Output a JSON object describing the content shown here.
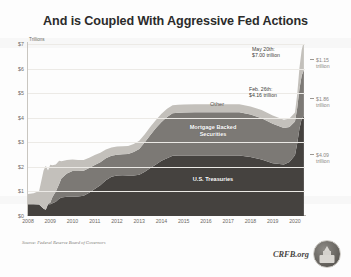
{
  "title": "And is Coupled With Aggressive Fed Actions",
  "axes": {
    "y_unit": "Trillions",
    "y_ticks": [
      "$7",
      "$6",
      "$5",
      "$4",
      "$3",
      "$2",
      "$1",
      "$0"
    ],
    "x_ticks": [
      "2008",
      "2009",
      "2010",
      "2011",
      "2012",
      "2013",
      "2014",
      "2015",
      "2016",
      "2017",
      "2018",
      "2019",
      "2020"
    ]
  },
  "series_labels": {
    "other": "Other",
    "mbs": "Mortgage Backed\nSecurities",
    "treasuries": "U.S. Treasuries"
  },
  "callouts": {
    "may": "May 20th:\n$7.00 trillion",
    "feb": "Feb. 26th:\n$4.16 trillion"
  },
  "right_labels": {
    "other": "$1.15\ntrillion",
    "mbs": "$1.86\ntrillion",
    "treasuries": "$4.09\ntrillion"
  },
  "footer": {
    "source": "Source: Federal Reserve Board of Governors",
    "brand": "CRFB.org",
    "logo_icon": "capitol-dome-icon"
  },
  "colors": {
    "other": "#c3c0bb",
    "mbs": "#7c7975",
    "treasuries": "#45423f",
    "title": "#2b2b2b",
    "axis": "#6d6a65"
  },
  "chart_data": {
    "type": "area",
    "title": "And is Coupled With Aggressive Fed Actions",
    "subtitle": "",
    "xlabel": "",
    "ylabel": "Trillions",
    "ylim": [
      0,
      7
    ],
    "xlim": [
      2008,
      2020.45
    ],
    "grid": true,
    "stacked": true,
    "legend": "inline-labels",
    "annotations": [
      {
        "text": "May 20th: $7.00 trillion",
        "x": 2020.38,
        "y": 7.0
      },
      {
        "text": "Feb. 26th: $4.16 trillion",
        "x": 2020.15,
        "y": 4.16
      },
      {
        "text": "$1.15 trillion",
        "x": 2020.45,
        "y": 6.43
      },
      {
        "text": "$1.86 trillion",
        "x": 2020.45,
        "y": 5.02
      },
      {
        "text": "$4.09 trillion",
        "x": 2020.45,
        "y": 2.05
      }
    ],
    "x": [
      2008.0,
      2008.25,
      2008.5,
      2008.7,
      2008.8,
      2008.9,
      2009.0,
      2009.1,
      2009.25,
      2009.4,
      2009.5,
      2009.75,
      2010.0,
      2010.25,
      2010.5,
      2010.75,
      2011.0,
      2011.25,
      2011.5,
      2011.75,
      2012.0,
      2012.25,
      2012.5,
      2012.75,
      2013.0,
      2013.25,
      2013.5,
      2013.75,
      2014.0,
      2014.25,
      2014.5,
      2014.75,
      2015.0,
      2015.5,
      2016.0,
      2016.5,
      2017.0,
      2017.5,
      2018.0,
      2018.5,
      2019.0,
      2019.5,
      2019.75,
      2020.0,
      2020.1,
      2020.2,
      2020.3,
      2020.4
    ],
    "series": [
      {
        "name": "U.S. Treasuries",
        "color": "#45423f",
        "values": [
          0.48,
          0.48,
          0.47,
          0.3,
          0.25,
          0.48,
          0.48,
          0.52,
          0.58,
          0.7,
          0.75,
          0.78,
          0.78,
          0.79,
          0.82,
          0.95,
          1.1,
          1.25,
          1.45,
          1.6,
          1.65,
          1.66,
          1.65,
          1.65,
          1.68,
          1.8,
          1.95,
          2.1,
          2.25,
          2.35,
          2.45,
          2.46,
          2.46,
          2.46,
          2.46,
          2.46,
          2.46,
          2.46,
          2.4,
          2.3,
          2.15,
          2.1,
          2.2,
          2.47,
          2.95,
          3.55,
          3.95,
          4.09
        ]
      },
      {
        "name": "Mortgage Backed Securities",
        "color": "#7c7975",
        "values": [
          0.0,
          0.0,
          0.0,
          0.0,
          0.0,
          0.02,
          0.06,
          0.25,
          0.42,
          0.6,
          0.78,
          0.95,
          1.05,
          1.04,
          1.02,
          1.0,
          0.98,
          0.94,
          0.9,
          0.85,
          0.84,
          0.85,
          0.87,
          0.95,
          1.05,
          1.2,
          1.35,
          1.48,
          1.58,
          1.68,
          1.73,
          1.74,
          1.75,
          1.76,
          1.76,
          1.76,
          1.76,
          1.76,
          1.73,
          1.68,
          1.6,
          1.48,
          1.42,
          1.38,
          1.45,
          1.62,
          1.76,
          1.86
        ]
      },
      {
        "name": "Other",
        "color": "#c3c0bb",
        "values": [
          0.42,
          0.45,
          0.55,
          1.55,
          1.8,
          1.35,
          1.55,
          1.3,
          1.1,
          0.95,
          0.7,
          0.55,
          0.47,
          0.45,
          0.44,
          0.42,
          0.4,
          0.38,
          0.36,
          0.34,
          0.34,
          0.33,
          0.33,
          0.33,
          0.33,
          0.33,
          0.33,
          0.33,
          0.33,
          0.33,
          0.33,
          0.33,
          0.33,
          0.33,
          0.33,
          0.33,
          0.33,
          0.33,
          0.33,
          0.33,
          0.34,
          0.34,
          0.35,
          0.36,
          0.55,
          0.85,
          1.05,
          1.15
        ]
      }
    ]
  }
}
